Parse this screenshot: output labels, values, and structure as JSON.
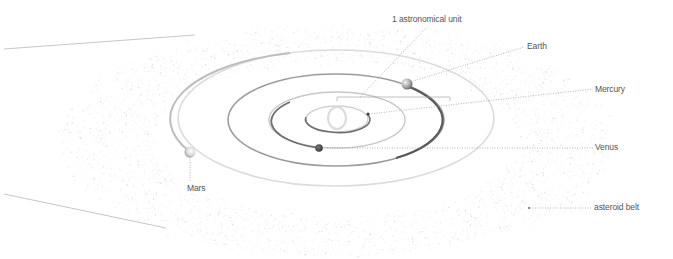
{
  "diagram": {
    "labels": {
      "au": "1 astronomical unit",
      "earth": "Earth",
      "mercury": "Mercury",
      "venus": "Venus",
      "mars": "Mars",
      "asteroid_belt": "asteroid belt"
    },
    "colors": {
      "background": "#ffffff",
      "text": "#555555",
      "leader": "#9a9a9a",
      "orbit_light": "#d8d8d8",
      "orbit_dark": "#555555",
      "asteroid_dot": "#c8c8c8"
    },
    "bodies": [
      {
        "name": "Sun",
        "cx": 337,
        "cy": 118
      },
      {
        "name": "Mercury",
        "cx": 368,
        "cy": 116
      },
      {
        "name": "Venus",
        "cx": 319,
        "cy": 148
      },
      {
        "name": "Earth",
        "cx": 407,
        "cy": 84
      },
      {
        "name": "Mars",
        "cx": 190,
        "cy": 152
      }
    ]
  }
}
